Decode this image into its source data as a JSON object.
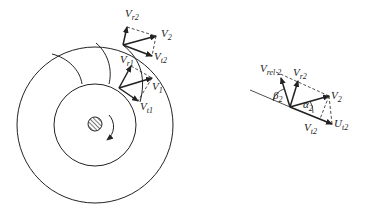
{
  "diagram": {
    "impeller": {
      "description": "Centrifugal impeller with inlet and outlet velocity triangles",
      "labels": {
        "vr2": {
          "main": "V",
          "sub": "r2"
        },
        "v2": {
          "main": "V",
          "sub": "2"
        },
        "vt2": {
          "main": "V",
          "sub": "t2"
        },
        "vr1": {
          "main": "V",
          "sub": "r1"
        },
        "v1": {
          "main": "V",
          "sub": "1"
        },
        "vt1": {
          "main": "V",
          "sub": "t1"
        }
      }
    },
    "outlet_triangle": {
      "labels": {
        "vrel2": {
          "main": "V",
          "sub": "rel 2"
        },
        "vr2": {
          "main": "V",
          "sub": "r2"
        },
        "beta2": {
          "main": "β",
          "sub": "2"
        },
        "alpha2": {
          "main": "α",
          "sub": "2"
        },
        "v2": {
          "main": "V",
          "sub": "2"
        },
        "vt2": {
          "main": "V",
          "sub": "t2"
        },
        "ut2": {
          "main": "U",
          "sub": "t2"
        }
      }
    },
    "colors": {
      "line": "#222222",
      "background": "#ffffff"
    }
  }
}
